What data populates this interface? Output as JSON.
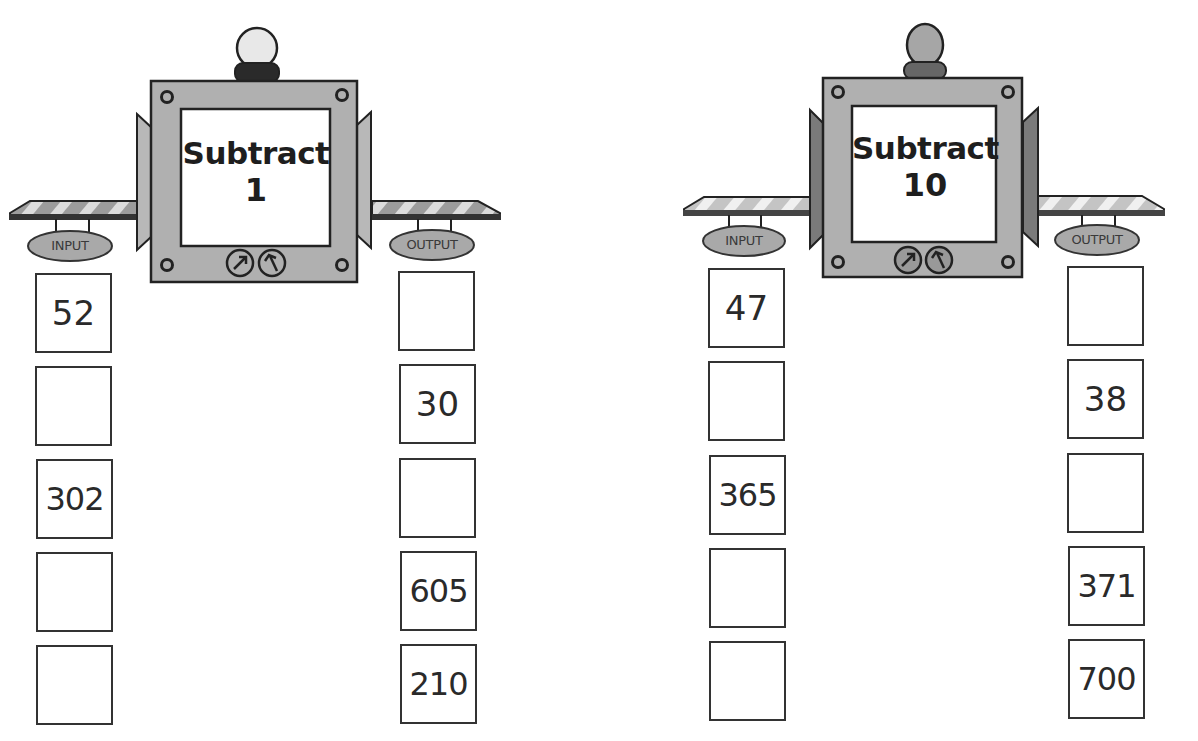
{
  "worksheet": {
    "machines": [
      {
        "operation": "Subtract",
        "value": "1",
        "input_label": "INPUT",
        "output_label": "OUTPUT",
        "bulb_color": "#e8e8e8",
        "bulb_base_color": "#2a2a2a",
        "side_flap_color": "#b8b8b8",
        "inputs": [
          "52",
          "",
          "302",
          "",
          ""
        ],
        "outputs": [
          "",
          "30",
          "",
          "605",
          "210"
        ]
      },
      {
        "operation": "Subtract",
        "value": "10",
        "input_label": "INPUT",
        "output_label": "OUTPUT",
        "bulb_color": "#a6a6a6",
        "bulb_base_color": "#666666",
        "side_flap_color": "#7a7a7a",
        "inputs": [
          "47",
          "",
          "365",
          "",
          ""
        ],
        "outputs": [
          "",
          "38",
          "",
          "371",
          "700"
        ]
      }
    ],
    "colors": {
      "machine_body": "#b0b0b0",
      "outline": "#222222",
      "screen": "#ffffff",
      "sign": "#a9a9a9"
    }
  }
}
